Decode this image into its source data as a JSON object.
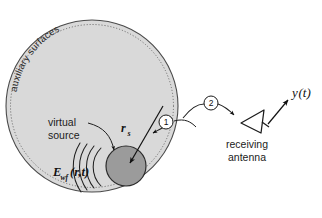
{
  "figure": {
    "background_color": "#ffffff",
    "width": 322,
    "height": 218
  },
  "domain": {
    "name": "auxiliary-surface-disk",
    "fill_color": "#d9d9d9",
    "stroke_color": "#4a4a4a",
    "center": [
      92,
      106
    ],
    "radius": 86,
    "inner_dashed_radius": 82,
    "curved_label": "auxiliary surfaces"
  },
  "virtual_source": {
    "label_line1": "virtual",
    "label_line2": "source",
    "sphere_fill": "#9b9b9b",
    "sphere_stroke": "#2b2b2b",
    "center": [
      126,
      166
    ],
    "radius": 20
  },
  "vectors": {
    "position_vector_label": "r",
    "position_vector_subscript": "s"
  },
  "wavefield": {
    "label_main": "E",
    "label_subscript": "wf",
    "label_args": "(r,t)",
    "arc_count": 4
  },
  "markers": [
    {
      "name": "marker-one",
      "text": "1",
      "cx": 166,
      "cy": 122,
      "r": 7
    },
    {
      "name": "marker-two",
      "text": "2",
      "cx": 211,
      "cy": 103,
      "r": 7
    }
  ],
  "antenna": {
    "label_line1": "receiving",
    "label_line2": "antenna",
    "stroke_color": "#1b1b1b"
  },
  "output": {
    "signal_label": "y",
    "signal_args": "(t)"
  }
}
